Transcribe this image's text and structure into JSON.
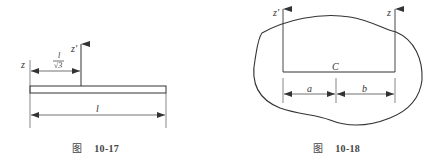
{
  "figures": [
    {
      "id": "fig-10-17",
      "caption_prefix": "图",
      "caption_number": "10-17",
      "labels": {
        "z_axis": "z",
        "z_prime_axis": "z'",
        "offset_numerator": "l",
        "offset_denominator": "√3",
        "length": "l"
      },
      "description": "Thin rod of length l with z axis at its end and z' axis at distance l/√3"
    },
    {
      "id": "fig-10-18",
      "caption_prefix": "图",
      "caption_number": "10-18",
      "labels": {
        "z_prime_axis": "z'",
        "z_axis": "z",
        "center": "C",
        "dim_a": "a",
        "dim_b": "b"
      },
      "description": "Irregular body with parallel axes z' and z, centre of mass C, distances a and b"
    }
  ],
  "colors": {
    "line": "#333333",
    "background": "#ffffff"
  }
}
